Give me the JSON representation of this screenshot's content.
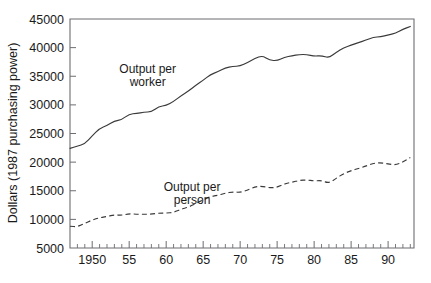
{
  "figure": {
    "faded_header": "",
    "background_color": "#ffffff",
    "ink_color": "#1a1a1a"
  },
  "chart_data": {
    "type": "line",
    "title": "",
    "xlabel": "",
    "ylabel": "Dollars (1987 purchasing power)",
    "xlim": [
      1947,
      1993.5
    ],
    "ylim": [
      5000,
      45000
    ],
    "grid": false,
    "legend": "inline-annotations",
    "y_ticks": [
      5000,
      10000,
      15000,
      20000,
      25000,
      30000,
      35000,
      40000,
      45000
    ],
    "y_tick_labels": [
      "5000",
      "10000",
      "15000",
      "20000",
      "25000",
      "30000",
      "35000",
      "40000",
      "45000"
    ],
    "x_ticks": [
      1950,
      1955,
      1960,
      1965,
      1970,
      1975,
      1980,
      1985,
      1990
    ],
    "x_tick_labels": [
      "1950",
      "55",
      "60",
      "65",
      "70",
      "75",
      "80",
      "85",
      "90"
    ],
    "x_minor_tick_step": 1,
    "annotations": [
      {
        "text_line1": "Output per",
        "text_line2": "worker",
        "x": 1957.5,
        "y": 35600
      },
      {
        "text_line1": "Output per",
        "text_line2": "person",
        "x": 1963.5,
        "y": 14900
      }
    ],
    "x": [
      1947,
      1948,
      1949,
      1950,
      1951,
      1952,
      1953,
      1954,
      1955,
      1956,
      1957,
      1958,
      1959,
      1960,
      1961,
      1962,
      1963,
      1964,
      1965,
      1966,
      1967,
      1968,
      1969,
      1970,
      1971,
      1972,
      1973,
      1974,
      1975,
      1976,
      1977,
      1978,
      1979,
      1980,
      1981,
      1982,
      1983,
      1984,
      1985,
      1986,
      1987,
      1988,
      1989,
      1990,
      1991,
      1992,
      1993
    ],
    "series": [
      {
        "name": "Output per worker",
        "style": "solid",
        "values": [
          22400,
          22800,
          23200,
          24600,
          25900,
          26400,
          27200,
          27400,
          28400,
          28500,
          28700,
          28800,
          29700,
          29900,
          30600,
          31600,
          32400,
          33400,
          34300,
          35300,
          35800,
          36500,
          36700,
          36800,
          37400,
          38100,
          38600,
          37800,
          37700,
          38300,
          38600,
          38800,
          38800,
          38500,
          38600,
          38200,
          39200,
          40000,
          40400,
          40900,
          41300,
          41800,
          41900,
          42200,
          42500,
          43200,
          43700
        ]
      },
      {
        "name": "Output per person",
        "style": "dashed",
        "values": [
          8800,
          8700,
          9300,
          9900,
          10300,
          10500,
          10800,
          10700,
          11000,
          10900,
          10900,
          10900,
          11100,
          11100,
          11200,
          11800,
          12100,
          12800,
          13400,
          14000,
          14200,
          14600,
          14800,
          14700,
          15100,
          15700,
          15800,
          15500,
          15600,
          16200,
          16500,
          16800,
          16900,
          16700,
          16800,
          16300,
          17200,
          18000,
          18500,
          18900,
          19300,
          19800,
          19900,
          19700,
          19500,
          20000,
          20800
        ]
      }
    ]
  }
}
